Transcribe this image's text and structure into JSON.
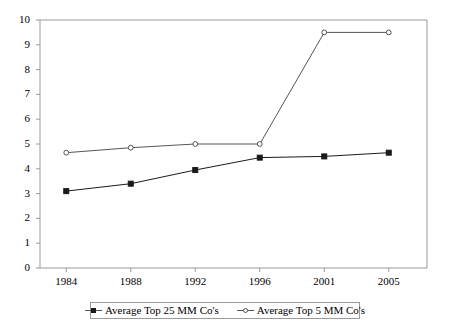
{
  "chart_data": {
    "type": "line",
    "title": "",
    "subtitle": "",
    "xlabel": "",
    "ylabel": "",
    "categories": [
      "1984",
      "1988",
      "1992",
      "1996",
      "2001",
      "2005"
    ],
    "ylim": [
      0,
      10
    ],
    "yticks": [
      "0",
      "1",
      "2",
      "3",
      "4",
      "5",
      "6",
      "7",
      "8",
      "9",
      "10"
    ],
    "ytick_step": 1,
    "grid": false,
    "legend_position": "bottom",
    "series": [
      {
        "name": "Average Top 25 MM Co's",
        "marker": "filled-square",
        "color": "#1a1a1a",
        "values": [
          3.1,
          3.4,
          3.95,
          4.45,
          4.5,
          4.65
        ]
      },
      {
        "name": "Average Top 5 MM Co's",
        "marker": "open-circle",
        "color": "#555555",
        "values": [
          4.65,
          4.85,
          5.0,
          5.0,
          9.5,
          9.5
        ]
      }
    ]
  },
  "legend": {
    "entries": [
      {
        "label": "Average Top 25 MM Co's"
      },
      {
        "label": "Average Top 5 MM Co's"
      }
    ]
  },
  "colors": {
    "axis": "#9a9a9a",
    "series_1": "#1a1a1a",
    "series_2": "#555555",
    "background": "#ffffff"
  }
}
